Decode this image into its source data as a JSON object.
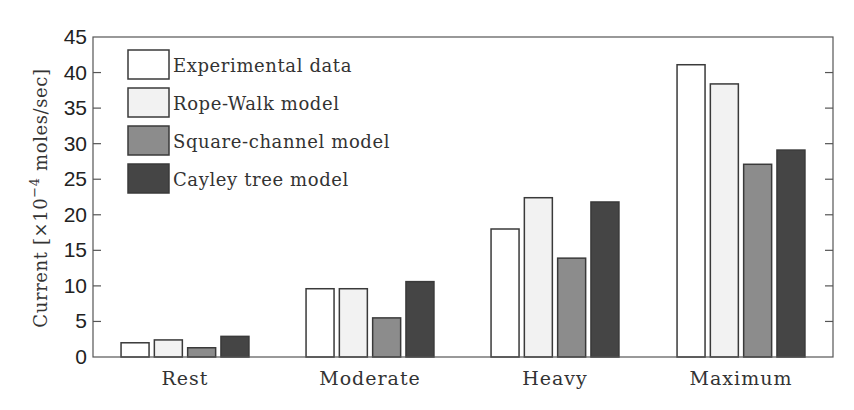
{
  "chart_data": {
    "type": "bar",
    "title": "",
    "xlabel": "",
    "ylabel": "Current [×10⁻⁴ moles/sec]",
    "ylabel_parts": {
      "prefix": "Current [×10",
      "exponent": "−4",
      "suffix": " moles/sec]"
    },
    "ylim": [
      0,
      45
    ],
    "yticks": [
      0,
      5,
      10,
      15,
      20,
      25,
      30,
      35,
      40,
      45
    ],
    "grid": false,
    "legend_position": "upper left",
    "categories": [
      "Rest",
      "Moderate",
      "Heavy",
      "Maximum"
    ],
    "series": [
      {
        "name": "Experimental data",
        "color": "#ffffff",
        "values": [
          2.0,
          9.6,
          18.0,
          41.1
        ]
      },
      {
        "name": "Rope-Walk model",
        "color": "#f2f2f2",
        "values": [
          2.4,
          9.6,
          22.4,
          38.4
        ]
      },
      {
        "name": "Square-channel model",
        "color": "#8c8c8c",
        "values": [
          1.3,
          5.5,
          13.9,
          27.1
        ]
      },
      {
        "name": "Cayley tree model",
        "color": "#454545",
        "values": [
          2.9,
          10.6,
          21.8,
          29.1
        ]
      }
    ]
  }
}
